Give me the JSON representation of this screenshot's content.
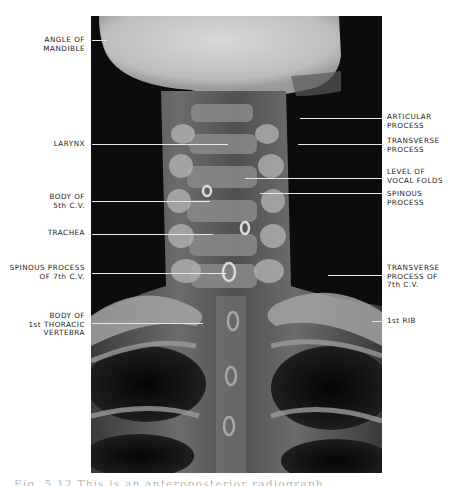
{
  "figure": {
    "type": "radiograph",
    "view": "anteroposterior cervical spine",
    "caption_partial": "Fig. 5.12  This is an anteroposterior radiograph"
  },
  "labels_left": [
    {
      "id": "angle-of-mandible",
      "text": "ANGLE OF\nMANDIBLE",
      "top": 36,
      "line_y": 40,
      "line_x1": 92,
      "line_x2": 107
    },
    {
      "id": "larynx",
      "text": "LARYNX",
      "top": 140,
      "line_y": 144,
      "line_x1": 92,
      "line_x2": 228
    },
    {
      "id": "body-of-5th-cv",
      "text": "BODY OF\n5th C.V.",
      "top": 193,
      "line_y": 201,
      "line_x1": 92,
      "line_x2": 210
    },
    {
      "id": "trachea",
      "text": "TRACHEA",
      "top": 229,
      "line_y": 234,
      "line_x1": 92,
      "line_x2": 213
    },
    {
      "id": "spinous-process-7th-cv",
      "text": "SPINOUS PROCESS\nOF 7th C.V.",
      "top": 264,
      "line_y": 273,
      "line_x1": 92,
      "line_x2": 226
    },
    {
      "id": "body-of-1st-thoracic-vertebra",
      "text": "BODY OF\n1st THORACIC\nVERTEBRA",
      "top": 312,
      "line_y": 323,
      "line_x1": 92,
      "line_x2": 203
    }
  ],
  "labels_right": [
    {
      "id": "articular-process",
      "text": "ARTICULAR\nPROCESS",
      "top": 113,
      "line_y": 118,
      "line_x1": 300,
      "line_x2": 382
    },
    {
      "id": "transverse-process",
      "text": "TRANSVERSE\nPROCESS",
      "top": 137,
      "line_y": 144,
      "line_x1": 298,
      "line_x2": 382
    },
    {
      "id": "level-of-vocal-folds",
      "text": "LEVEL OF\nVOCAL FOLDS",
      "top": 168,
      "line_y": 178,
      "line_x1": 245,
      "line_x2": 382
    },
    {
      "id": "spinous-process",
      "text": "SPINOUS\nPROCESS",
      "top": 190,
      "line_y": 193,
      "line_x1": 260,
      "line_x2": 382
    },
    {
      "id": "transverse-process-7th-cv",
      "text": "TRANSVERSE\nPROCESS OF\n7th C.V.",
      "top": 264,
      "line_y": 275,
      "line_x1": 328,
      "line_x2": 382
    },
    {
      "id": "1st-rib",
      "text": "1st RIB",
      "top": 317,
      "line_y": 321,
      "line_x1": 372,
      "line_x2": 382
    }
  ]
}
